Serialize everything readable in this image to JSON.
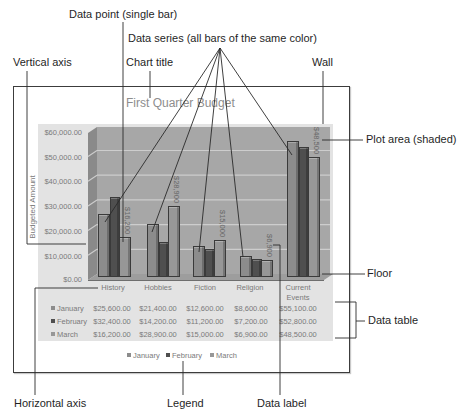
{
  "callouts": {
    "data_point": "Data point (single bar)",
    "data_series": "Data series (all bars of the same color)",
    "vertical_axis": "Vertical axis",
    "chart_title": "Chart title",
    "wall": "Wall",
    "plot_area": "Plot area (shaded)",
    "floor": "Floor",
    "data_table": "Data table",
    "horizontal_axis": "Horizontal axis",
    "legend": "Legend",
    "data_label": "Data label"
  },
  "chart": {
    "title": "First Quarter Budget",
    "y_axis_title": "Budgeted Amount",
    "y_ticks": [
      "$60,000.00",
      "$50,000.00",
      "$40,000.00",
      "$30,000.00",
      "$20,000.00",
      "$10,000.00",
      "$0.00"
    ],
    "categories": [
      "History",
      "Hobbies",
      "Fiction",
      "Religion",
      "Current Events"
    ],
    "table": {
      "rows": [
        {
          "label": "January",
          "values": [
            "$25,600.00",
            "$21,400.00",
            "$12,600.00",
            "$8,600.00",
            "$55,100.00"
          ]
        },
        {
          "label": "February",
          "values": [
            "$32,400.00",
            "$14,200.00",
            "$11,200.00",
            "$7,200.00",
            "$52,800.00"
          ]
        },
        {
          "label": "March",
          "values": [
            "$16,200.00",
            "$28,900.00",
            "$15,000.00",
            "$6,900.00",
            "$48,500.00"
          ]
        }
      ]
    },
    "legend": [
      "January",
      "February",
      "March"
    ],
    "data_labels": [
      "$16,200",
      "$28,900",
      "$15,000",
      "$6,900",
      "$48,500"
    ]
  },
  "colors": {
    "plot_area": "#e3e3e3",
    "back_wall": "#a7a7a7",
    "side_wall": "#8a8a8a",
    "floor": "#9d9d9d",
    "gridline": "#cdcdcd"
  },
  "chart_data": {
    "type": "bar",
    "subtype": "3d-clustered-column",
    "title": "First Quarter Budget",
    "xlabel": "",
    "ylabel": "Budgeted Amount",
    "ylim": [
      0,
      60000
    ],
    "y_ticks": [
      0,
      10000,
      20000,
      30000,
      40000,
      50000,
      60000
    ],
    "grid": true,
    "legend_position": "bottom",
    "data_table": true,
    "categories": [
      "History",
      "Hobbies",
      "Fiction",
      "Religion",
      "Current Events"
    ],
    "series": [
      {
        "name": "January",
        "values": [
          25600,
          21400,
          12600,
          8600,
          55100
        ],
        "color": "#8c8c8c"
      },
      {
        "name": "February",
        "values": [
          32400,
          14200,
          11200,
          7200,
          52800
        ],
        "color": "#4f4f4f"
      },
      {
        "name": "March",
        "values": [
          16200,
          28900,
          15000,
          6900,
          48500
        ],
        "color": "#979797"
      }
    ],
    "data_labels": {
      "series": "March",
      "labels": [
        "$16,200",
        "$28,900",
        "$15,000",
        "$6,900",
        "$48,500"
      ]
    },
    "annotations": [
      "Data point (single bar)",
      "Data series (all bars of the same color)",
      "Vertical axis",
      "Chart title",
      "Wall",
      "Plot area (shaded)",
      "Floor",
      "Data table",
      "Horizontal axis",
      "Legend",
      "Data label"
    ]
  }
}
